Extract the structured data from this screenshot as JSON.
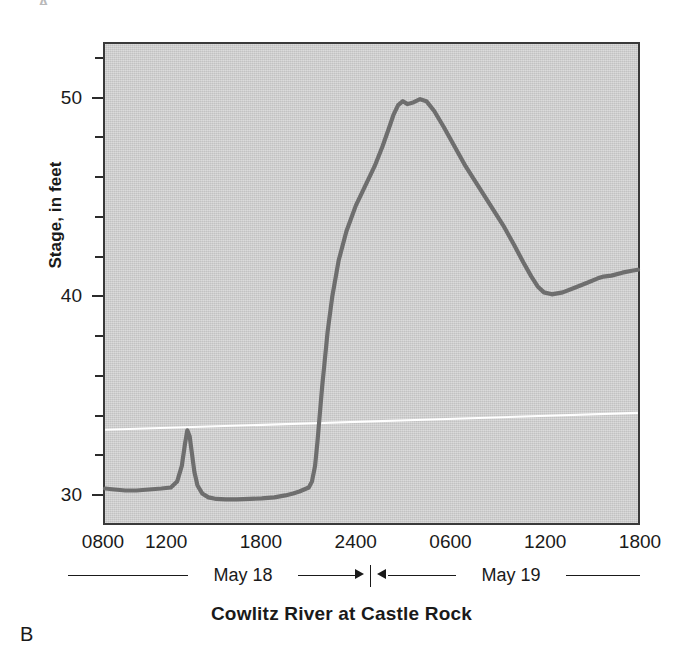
{
  "figure": {
    "panel_letter": "B",
    "title": "Cowlitz River at Castle Rock",
    "top_artifact": "A",
    "background_color": "#ffffff",
    "plot_background_color": "#cfcfcf",
    "frame_color": "#3a3a3a",
    "series_color": "#6e6e6e",
    "crease_color": "#ffffff"
  },
  "axes": {
    "y": {
      "label": "Stage, in feet",
      "tick_labels": [
        "50",
        "40",
        "30"
      ],
      "tick_values": [
        50,
        40,
        30
      ],
      "minor_tick_values": [
        52,
        48,
        46,
        44,
        42,
        38,
        36,
        34,
        32
      ],
      "range": [
        28.5,
        52.8
      ]
    },
    "x": {
      "label": "",
      "tick_labels": [
        "0800",
        "1200",
        "1800",
        "2400",
        "0600",
        "1200",
        "1800"
      ],
      "tick_hours": [
        8,
        12,
        18,
        24,
        30,
        36,
        42
      ],
      "range": [
        8,
        42
      ]
    }
  },
  "day_spans": [
    {
      "label": "May 18",
      "arrow": "right"
    },
    {
      "label": "May 19",
      "arrow": "left"
    }
  ],
  "chart_data": {
    "type": "line",
    "title": "Cowlitz River at Castle Rock",
    "xlabel": "",
    "ylabel": "Stage, in feet",
    "xlim": [
      8,
      42
    ],
    "ylim": [
      28.5,
      52.8
    ],
    "xtick_labels": [
      "0800",
      "1200",
      "1800",
      "2400",
      "0600",
      "1200",
      "1800"
    ],
    "xticks": [
      8,
      12,
      18,
      24,
      30,
      36,
      42
    ],
    "yticks": [
      30,
      40,
      50
    ],
    "yticks_minor": [
      32,
      34,
      36,
      38,
      42,
      44,
      46,
      48,
      52
    ],
    "grid": false,
    "legend": null,
    "x_unit": "hours from midnight May 18",
    "y_unit": "feet",
    "series": [
      {
        "name": "Stage",
        "color": "#6e6e6e",
        "x": [
          8.0,
          8.6,
          9.3,
          10.0,
          10.8,
          11.6,
          12.2,
          12.6,
          12.9,
          13.1,
          13.25,
          13.4,
          13.55,
          13.7,
          13.9,
          14.2,
          14.6,
          15.1,
          15.7,
          16.4,
          17.2,
          18.0,
          18.8,
          19.5,
          20.0,
          20.4,
          20.7,
          21.0,
          21.2,
          21.4,
          21.55,
          21.7,
          21.85,
          22.0,
          22.2,
          22.5,
          22.9,
          23.4,
          24.0,
          24.6,
          25.2,
          25.7,
          26.1,
          26.4,
          26.7,
          27.0,
          27.3,
          27.7,
          28.1,
          28.5,
          29.0,
          29.6,
          30.3,
          31.0,
          31.8,
          32.6,
          33.4,
          34.1,
          34.7,
          35.2,
          35.6,
          36.0,
          36.5,
          37.2,
          38.0,
          38.8,
          39.4,
          39.8,
          40.3,
          41.0,
          41.6,
          42.0
        ],
        "y": [
          30.25,
          30.2,
          30.15,
          30.15,
          30.2,
          30.25,
          30.3,
          30.6,
          31.4,
          32.5,
          33.2,
          32.9,
          32.0,
          31.1,
          30.4,
          30.0,
          29.8,
          29.72,
          29.7,
          29.7,
          29.72,
          29.75,
          29.8,
          29.9,
          30.0,
          30.1,
          30.2,
          30.3,
          30.6,
          31.4,
          32.6,
          34.0,
          35.4,
          36.6,
          38.2,
          40.0,
          41.8,
          43.3,
          44.6,
          45.6,
          46.6,
          47.6,
          48.5,
          49.2,
          49.7,
          49.9,
          49.75,
          49.85,
          50.0,
          49.9,
          49.4,
          48.6,
          47.6,
          46.6,
          45.6,
          44.6,
          43.6,
          42.6,
          41.7,
          41.0,
          40.5,
          40.2,
          40.1,
          40.2,
          40.45,
          40.7,
          40.9,
          41.0,
          41.05,
          41.2,
          41.3,
          41.35
        ]
      }
    ],
    "annotations": [
      {
        "text": "May 18",
        "type": "span-label"
      },
      {
        "text": "May 19",
        "type": "span-label"
      }
    ]
  }
}
